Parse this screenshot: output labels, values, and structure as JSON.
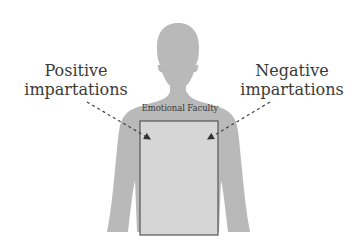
{
  "diagram": {
    "labels": {
      "positive": {
        "line1": "Positive",
        "line2": "impartations"
      },
      "negative": {
        "line1": "Negative",
        "line2": "impartations"
      },
      "box_title": "Emotional Faculty"
    },
    "colors": {
      "silhouette": "#b9b9b9",
      "box_fill": "#d6d6d6",
      "box_stroke": "#555555",
      "arrow": "#444444",
      "text": "#3a3a3a",
      "background": "#ffffff"
    },
    "nodes": [
      {
        "id": "positive",
        "label": "Positive impartations"
      },
      {
        "id": "negative",
        "label": "Negative impartations"
      },
      {
        "id": "emotional-faculty",
        "label": "Emotional Faculty"
      }
    ],
    "edges": [
      {
        "from": "positive",
        "to": "emotional-faculty",
        "style": "dashed-arrow"
      },
      {
        "from": "negative",
        "to": "emotional-faculty",
        "style": "dashed-arrow"
      }
    ]
  }
}
